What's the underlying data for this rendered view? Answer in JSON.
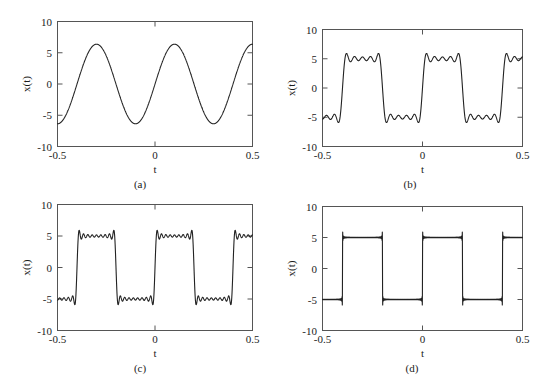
{
  "figure": {
    "background": "#ffffff",
    "curve_color": "#222222",
    "axis_color": "#555555",
    "panel_count": 4
  },
  "axes": {
    "xlabel": "t",
    "ylabel": "x(t)",
    "xticks": [
      "-0.5",
      "0",
      "0.5"
    ],
    "xtick_values": [
      -0.5,
      0,
      0.5
    ],
    "yticks": [
      "10",
      "5",
      "0",
      "-5",
      "-10"
    ],
    "ytick_values": [
      10,
      5,
      0,
      -5,
      -10
    ],
    "xlim": [
      -0.5,
      0.5
    ],
    "ylim": [
      -10,
      10
    ]
  },
  "captions": {
    "a": "(a)",
    "b": "(b)",
    "c": "(c)",
    "d": "(d)"
  },
  "chart_data": [
    {
      "id": "a",
      "type": "line",
      "title": "",
      "caption": "(a)",
      "xlabel": "t",
      "ylabel": "x(t)",
      "xlim": [
        -0.5,
        0.5
      ],
      "ylim": [
        -10,
        10
      ],
      "xticks": [
        -0.5,
        0,
        0.5
      ],
      "yticks": [
        -10,
        -5,
        0,
        5,
        10
      ],
      "xticklabels": [
        "-0.5",
        "0",
        "0.5"
      ],
      "yticklabels": [
        "-10",
        "-5",
        "0",
        "5",
        "10"
      ],
      "grid": false,
      "legend": false,
      "description": "Fundamental sine term only of a square-wave Fourier series; amplitude about 6.4, period 0.4 (2.5 cycles shown).",
      "series": [
        {
          "name": "N = 1 harmonic",
          "amplitude": 6.37,
          "period": 0.4,
          "frequency_hz": 2.5,
          "harmonics": [
            1
          ],
          "phase_offset": 0.0,
          "value_at_minus_0_5": -6.4,
          "peaks_t": [
            -0.3,
            0.1,
            0.5
          ],
          "peaks_y": [
            6.4,
            6.4,
            6.1
          ],
          "troughs_t": [
            -0.1,
            0.3
          ],
          "troughs_y": [
            -6.4,
            -6.7
          ]
        }
      ]
    },
    {
      "id": "b",
      "type": "line",
      "title": "",
      "caption": "(b)",
      "xlabel": "t",
      "ylabel": "x(t)",
      "xlim": [
        -0.5,
        0.5
      ],
      "ylim": [
        -10,
        10
      ],
      "xticks": [
        -0.5,
        0,
        0.5
      ],
      "yticks": [
        -10,
        -5,
        0,
        5,
        10
      ],
      "xticklabels": [
        "-0.5",
        "0",
        "0.5"
      ],
      "yticklabels": [
        "-10",
        "-5",
        "0",
        "5",
        "10"
      ],
      "grid": false,
      "legend": false,
      "description": "Square-wave Fourier partial sum with odd harmonics 1,3,5,7,9; three visible ripples on each flat top, overshoot to about 6.0.",
      "series": [
        {
          "name": "N = 5 odd harmonics",
          "amplitude": 5.0,
          "period": 0.4,
          "frequency_hz": 2.5,
          "harmonics": [
            1,
            3,
            5,
            7,
            9
          ],
          "overshoot_peak": 6.0,
          "plateau_level": 5.0,
          "undershoot_trough": -6.2,
          "ripples_per_plateau": 3
        }
      ]
    },
    {
      "id": "c",
      "type": "line",
      "title": "",
      "caption": "(c)",
      "xlabel": "t",
      "ylabel": "x(t)",
      "xlim": [
        -0.5,
        0.5
      ],
      "ylim": [
        -10,
        10
      ],
      "xticks": [
        -0.5,
        0,
        0.5
      ],
      "yticks": [
        -10,
        -5,
        0,
        5,
        10
      ],
      "xticklabels": [
        "-0.5",
        "0",
        "0.5"
      ],
      "yticklabels": [
        "-10",
        "-5",
        "0",
        "5",
        "10"
      ],
      "grid": false,
      "legend": false,
      "description": "Square-wave Fourier partial sum with odd harmonics 1..17; about six ripples on each flat top, steeper edges, overshoot near 5.9.",
      "series": [
        {
          "name": "N = 9 odd harmonics",
          "amplitude": 5.0,
          "period": 0.4,
          "frequency_hz": 2.5,
          "harmonics": [
            1,
            3,
            5,
            7,
            9,
            11,
            13,
            15,
            17
          ],
          "overshoot_peak": 5.9,
          "plateau_level": 5.0,
          "undershoot_trough": -6.1,
          "ripples_per_plateau": 6
        }
      ]
    },
    {
      "id": "d",
      "type": "line",
      "title": "",
      "caption": "(d)",
      "xlabel": "t",
      "ylabel": "x(t)",
      "xlim": [
        -0.5,
        0.5
      ],
      "ylim": [
        -10,
        10
      ],
      "xticks": [
        -0.5,
        0,
        0.5
      ],
      "yticks": [
        -10,
        -5,
        0,
        5,
        10
      ],
      "xticklabels": [
        "-0.5",
        "0",
        "0.5"
      ],
      "yticklabels": [
        "-10",
        "-5",
        "0",
        "5",
        "10"
      ],
      "grid": false,
      "legend": false,
      "description": "Square-wave Fourier partial sum with very many odd harmonics; essentially an ideal square wave of amplitude 5 with narrow Gibbs overshoot spikes at every transition.",
      "series": [
        {
          "name": "N = 99 odd harmonics",
          "amplitude": 5.0,
          "period": 0.4,
          "frequency_hz": 2.5,
          "harmonics_max": 199,
          "overshoot_peak": 5.9,
          "plateau_level": 5.0,
          "undershoot_trough": -5.9,
          "gibbs_spikes": true,
          "transition_times": [
            -0.4,
            -0.2,
            0.0,
            0.2,
            0.4
          ]
        }
      ]
    }
  ]
}
